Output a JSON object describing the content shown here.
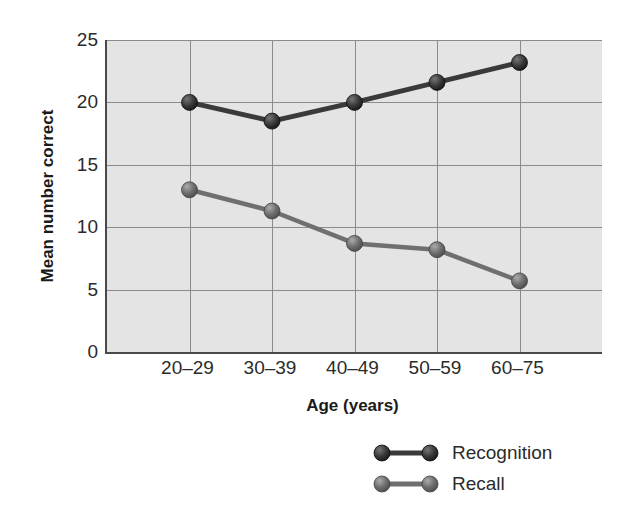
{
  "chart_data": {
    "type": "line",
    "title": "",
    "xlabel": "Age (years)",
    "ylabel": "Mean number correct",
    "categories": [
      "20–29",
      "30–39",
      "40–49",
      "50–59",
      "60–75"
    ],
    "ylim": [
      0,
      25
    ],
    "yticks": [
      0,
      5,
      10,
      15,
      20,
      25
    ],
    "ytick_labels": [
      "0",
      "5",
      "10",
      "15",
      "20",
      "25"
    ],
    "grid": "both",
    "legend_position": "below-right",
    "series": [
      {
        "name": "Recognition",
        "color": "#3a3a3a",
        "values": [
          20.0,
          18.5,
          20.0,
          21.6,
          23.2
        ]
      },
      {
        "name": "Recall",
        "color": "#6f6f6f",
        "values": [
          13.0,
          11.3,
          8.7,
          8.2,
          5.7
        ]
      }
    ]
  },
  "axes": {
    "y_title": "Mean number correct",
    "x_title": "Age (years)",
    "y_tick_labels": [
      "25",
      "20",
      "15",
      "10",
      "5",
      "0"
    ],
    "x_tick_labels": [
      "20–29",
      "30–39",
      "40–49",
      "50–59",
      "60–75"
    ]
  },
  "legend": {
    "items": [
      {
        "label": "Recognition",
        "color": "#3a3a3a"
      },
      {
        "label": "Recall",
        "color": "#6f6f6f"
      }
    ]
  },
  "colors": {
    "plot_background": "#e4e4e4",
    "gridline": "#8b8b8b",
    "axis": "#4a4a4a",
    "text": "#2b2b2b",
    "recognition": "#3a3a3a",
    "recall": "#6f6f6f",
    "page_background": "#ffffff"
  }
}
